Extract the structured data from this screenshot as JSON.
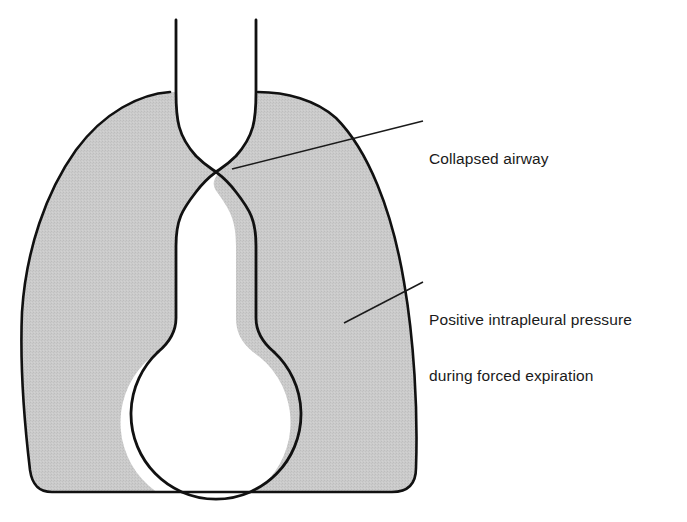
{
  "figure": {
    "kind": "anatomical-diagram",
    "background_color": "#ffffff"
  },
  "labels": {
    "collapsed_airway": {
      "name": "collapsed-airway-label",
      "text": "Collapsed airway",
      "lines": [
        "Collapsed airway"
      ]
    },
    "intrapleural_pressure": {
      "name": "intrapleural-pressure-label",
      "text": "Positive intrapleural pressure during forced expiration",
      "lines": [
        "Positive intrapleural pressure",
        "during forced expiration"
      ]
    }
  },
  "colors": {
    "pleura_fill": "#c9c9c9",
    "stroke": "#111111",
    "lumen_fill": "#ffffff",
    "leader_line": "#1a1a1a",
    "text": "#1a1a1a"
  },
  "anatomy": {
    "trachea": {
      "name": "trachea",
      "left_wall_x": 170,
      "right_wall_x": 258,
      "top_y": 20,
      "bottom_y": 92
    },
    "collapse_point": {
      "name": "airway-collapse-point",
      "x": 216,
      "y": 172,
      "description": "Airway pinched nearly shut by surrounding positive pressure"
    },
    "bronchus": {
      "name": "bronchus",
      "left_x": 168,
      "right_x": 245,
      "top_y": 200,
      "bottom_y": 330
    },
    "alveolus": {
      "name": "alveolus",
      "center_x": 205,
      "center_y": 385,
      "radius": 85
    },
    "pleural_space": {
      "name": "pleural-space",
      "left_x": 22,
      "right_x": 420,
      "top_y": 92,
      "bottom_y": 492
    }
  },
  "leader_lines": [
    {
      "name": "leader-line-collapsed-airway",
      "from_x": 232,
      "from_y": 169,
      "to_x": 423,
      "to_y": 121
    },
    {
      "name": "leader-line-intrapleural-pressure",
      "from_x": 344,
      "from_y": 323,
      "to_x": 423,
      "to_y": 282
    }
  ]
}
